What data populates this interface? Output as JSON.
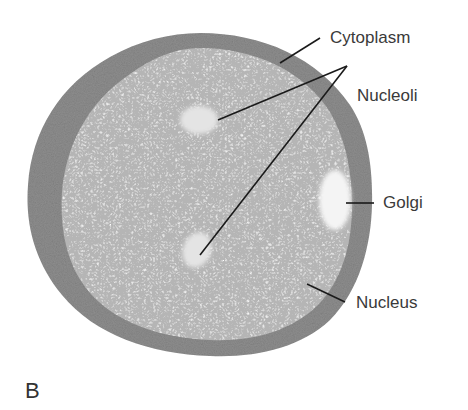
{
  "figure": {
    "panel_letter": "B",
    "colors": {
      "cytoplasm": "#8e8e8e",
      "nucleus": "#b9b9b9",
      "nucleolus": "#e2e2e2",
      "golgi": "#f4f4f4",
      "leader_line": "#1a1a1a",
      "label_text": "#3a3a3a"
    },
    "labels": {
      "cytoplasm": "Cytoplasm",
      "nucleoli": "Nucleoli",
      "golgi": "Golgi",
      "nucleus": "Nucleus"
    }
  }
}
